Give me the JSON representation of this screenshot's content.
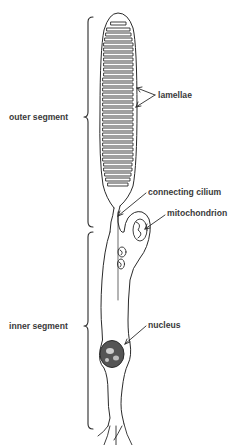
{
  "figure": {
    "labels": {
      "outer_segment": "outer segment",
      "inner_segment": "inner segment",
      "lamellae": "lamellae",
      "connecting_cilium": "connecting cilium",
      "mitochondrion": "mitochondrion",
      "nucleus": "nucleus"
    },
    "colors": {
      "ink": "#2a2a2a",
      "text": "#3a3a3a",
      "background": "#ffffff"
    }
  }
}
